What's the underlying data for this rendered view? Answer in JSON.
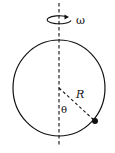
{
  "diagram": {
    "type": "rotating-hoop-with-bead",
    "labels": {
      "omega": "ω",
      "radius": "R",
      "angle": "θ"
    },
    "colors": {
      "stroke": "#111111",
      "background": "#ffffff"
    }
  }
}
